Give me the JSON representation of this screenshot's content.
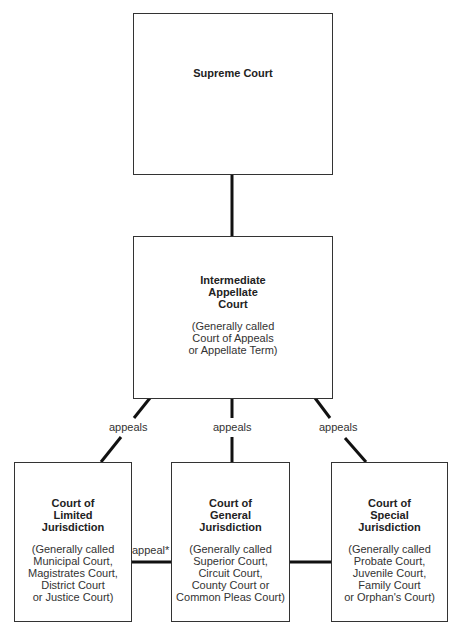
{
  "diagram": {
    "supreme": {
      "title": [
        "Supreme Court"
      ],
      "subtitle": []
    },
    "intermediate": {
      "title": [
        "Intermediate",
        "Appellate",
        "Court"
      ],
      "subtitle": [
        "(Generally called",
        "Court of Appeals",
        "or Appellate Term)"
      ]
    },
    "limited": {
      "title": [
        "Court of",
        "Limited",
        "Jurisdiction"
      ],
      "subtitle": [
        "(Generally called",
        "Municipal Court,",
        "Magistrates Court,",
        "District Court",
        "or Justice Court)"
      ]
    },
    "general": {
      "title": [
        "Court of",
        "General",
        "Jurisdiction"
      ],
      "subtitle": [
        "(Generally called",
        "Superior Court,",
        "Circuit Court,",
        "County Court or",
        "Common Pleas Court)"
      ]
    },
    "special": {
      "title": [
        "Court of",
        "Special",
        "Jurisdiction"
      ],
      "subtitle": [
        "(Generally called",
        "Probate Court,",
        "Juvenile Court,",
        "Family Court",
        "or Orphan's Court)"
      ]
    },
    "edges": {
      "limited_label": "appeals",
      "general_label": "appeals",
      "special_label": "appeals",
      "limited_to_general_label": "appeal*"
    }
  }
}
